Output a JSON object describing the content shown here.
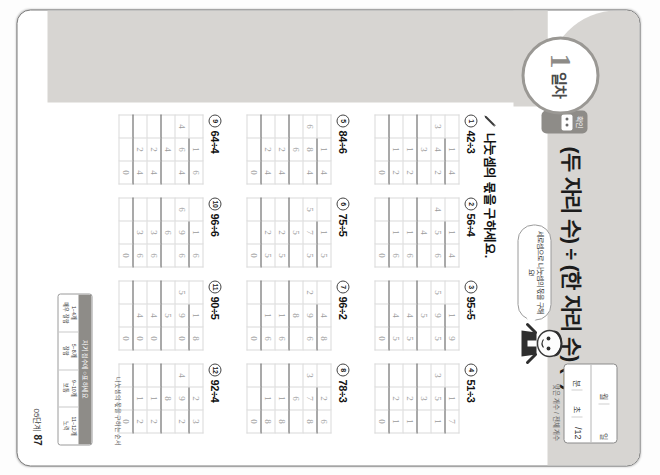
{
  "document": {
    "type": "korean-math-workbook-page",
    "rotation_degrees": 90
  },
  "header": {
    "day_number": "1",
    "day_label": "일차",
    "tab_label": "확인",
    "title": "(두 자리 수) ÷ (한 자리 수) (2)",
    "datebox": {
      "month_label": "월",
      "day_label": "일",
      "minute_label": "분",
      "second_label": "초",
      "score_value": "/12"
    },
    "date_note": "맞은 개수 / 전체 개수",
    "bubble_text": "세로셈으로 나눗셈의 몫을 구해요!",
    "mascot": "student-character"
  },
  "instruction": {
    "icon": "pencil-icon",
    "text": "나눗셈의 몫을 구하세요."
  },
  "footer": {
    "step_label": "05단계",
    "page_number": "87"
  },
  "reference": {
    "caption": "나눗셈의 몫을 구하는 순서",
    "head": "자기 점수에 ○표 하세요",
    "columns": [
      "1~4개\n매우 잘함",
      "5~8개\n잘함",
      "9~10개\n보통",
      "11~12개\n노력"
    ]
  },
  "problems": [
    {
      "num": "1",
      "expression": "42÷3",
      "quotient": [
        "1",
        "4"
      ],
      "divisor": "3",
      "dividend": [
        "4",
        "2"
      ],
      "rows": [
        [
          "",
          "3",
          ""
        ],
        [
          "",
          "1",
          "2"
        ],
        [
          "",
          "1",
          "2"
        ],
        [
          "",
          "",
          "0"
        ]
      ]
    },
    {
      "num": "2",
      "expression": "56÷4",
      "quotient": [
        "1",
        "4"
      ],
      "divisor": "4",
      "dividend": [
        "5",
        "6"
      ],
      "rows": [
        [
          "",
          "4",
          ""
        ],
        [
          "",
          "1",
          "6"
        ],
        [
          "",
          "1",
          "6"
        ],
        [
          "",
          "",
          "0"
        ]
      ]
    },
    {
      "num": "3",
      "expression": "95÷5",
      "quotient": [
        "1",
        "9"
      ],
      "divisor": "5",
      "dividend": [
        "9",
        "5"
      ],
      "rows": [
        [
          "",
          "5",
          ""
        ],
        [
          "",
          "4",
          "5"
        ],
        [
          "",
          "4",
          "5"
        ],
        [
          "",
          "",
          "0"
        ]
      ]
    },
    {
      "num": "4",
      "expression": "51÷3",
      "quotient": [
        "1",
        "7"
      ],
      "divisor": "3",
      "dividend": [
        "5",
        "1"
      ],
      "rows": [
        [
          "",
          "3",
          ""
        ],
        [
          "",
          "2",
          "1"
        ],
        [
          "",
          "2",
          "1"
        ],
        [
          "",
          "",
          "0"
        ]
      ]
    },
    {
      "num": "5",
      "expression": "84÷6",
      "quotient": [
        "1",
        "4"
      ],
      "divisor": "6",
      "dividend": [
        "8",
        "4"
      ],
      "rows": [
        [
          "",
          "6",
          ""
        ],
        [
          "",
          "2",
          "4"
        ],
        [
          "",
          "2",
          "4"
        ],
        [
          "",
          "",
          "0"
        ]
      ]
    },
    {
      "num": "6",
      "expression": "75÷5",
      "quotient": [
        "1",
        "5"
      ],
      "divisor": "5",
      "dividend": [
        "7",
        "5"
      ],
      "rows": [
        [
          "",
          "5",
          ""
        ],
        [
          "",
          "2",
          "5"
        ],
        [
          "",
          "2",
          "5"
        ],
        [
          "",
          "",
          "0"
        ]
      ]
    },
    {
      "num": "7",
      "expression": "96÷2",
      "quotient": [
        "4",
        "8"
      ],
      "divisor": "2",
      "dividend": [
        "9",
        "6"
      ],
      "rows": [
        [
          "",
          "8",
          ""
        ],
        [
          "",
          "1",
          "6"
        ],
        [
          "",
          "1",
          "6"
        ],
        [
          "",
          "",
          "0"
        ]
      ]
    },
    {
      "num": "8",
      "expression": "78÷3",
      "quotient": [
        "2",
        "6"
      ],
      "divisor": "3",
      "dividend": [
        "7",
        "8"
      ],
      "rows": [
        [
          "",
          "6",
          ""
        ],
        [
          "",
          "1",
          "8"
        ],
        [
          "",
          "1",
          "8"
        ],
        [
          "",
          "",
          "0"
        ]
      ]
    },
    {
      "num": "9",
      "expression": "64÷4",
      "quotient": [
        "1",
        "6"
      ],
      "divisor": "4",
      "dividend": [
        "6",
        "4"
      ],
      "rows": [
        [
          "",
          "4",
          ""
        ],
        [
          "",
          "2",
          "4"
        ],
        [
          "",
          "2",
          "4"
        ],
        [
          "",
          "",
          "0"
        ]
      ]
    },
    {
      "num": "10",
      "expression": "96÷6",
      "quotient": [
        "1",
        "6"
      ],
      "divisor": "6",
      "dividend": [
        "9",
        "6"
      ],
      "rows": [
        [
          "",
          "6",
          ""
        ],
        [
          "",
          "3",
          "6"
        ],
        [
          "",
          "3",
          "6"
        ],
        [
          "",
          "",
          "0"
        ]
      ]
    },
    {
      "num": "11",
      "expression": "90÷5",
      "quotient": [
        "1",
        "8"
      ],
      "divisor": "5",
      "dividend": [
        "9",
        "0"
      ],
      "rows": [
        [
          "",
          "5",
          ""
        ],
        [
          "",
          "4",
          "0"
        ],
        [
          "",
          "4",
          "0"
        ],
        [
          "",
          "",
          "0"
        ]
      ]
    },
    {
      "num": "12",
      "expression": "92÷4",
      "quotient": [
        "2",
        "3"
      ],
      "divisor": "4",
      "dividend": [
        "9",
        "2"
      ],
      "rows": [
        [
          "",
          "8",
          ""
        ],
        [
          "",
          "1",
          "2"
        ],
        [
          "",
          "1",
          "2"
        ],
        [
          "",
          "",
          "0"
        ]
      ]
    }
  ],
  "colors": {
    "band": "#d7d5d2",
    "ink": "#9b9b9b",
    "rule": "#555555",
    "grid": "#d9d9d9"
  }
}
